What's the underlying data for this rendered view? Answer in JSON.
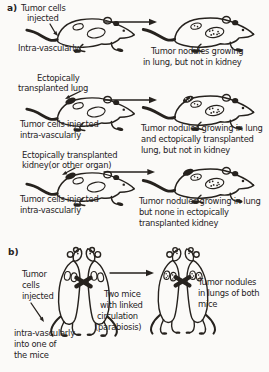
{
  "figure": {
    "ink_color": "#26221e",
    "paper_color": "#fbfaf8",
    "section_a": {
      "label": "a)",
      "row1": {
        "inject_label": [
          "Tumor cells",
          "injected"
        ],
        "route_label": "Intra-vascularly",
        "result_label": [
          "Tumor nodules growing",
          "in lung, but not in kidney"
        ]
      },
      "row2": {
        "transplant_label": [
          "Ectopically",
          "transplanted lung"
        ],
        "inject_label": [
          "Tumor cells injected",
          "intra-vascularly"
        ],
        "result_label": [
          "Tumor nodules growing in lung",
          "and ectopically transplanted",
          "lung, but not in kidney"
        ]
      },
      "row3": {
        "transplant_label": [
          "Ectopically transplanted",
          "kidney(or other organ)"
        ],
        "inject_label": [
          "Tumor cells injected",
          "intra-vascularly"
        ],
        "result_label": [
          "Tumor nodules growing in lung",
          "but none in ectopically",
          "transplanted kidney"
        ]
      }
    },
    "section_b": {
      "label": "b)",
      "inject_label": [
        "Tumor",
        "cells",
        "injected"
      ],
      "route_label": [
        "intra-vascularly",
        "into one of",
        "the mice"
      ],
      "parabiosis_label": [
        "Two mice",
        "with linked",
        "circulation",
        "(parabiosis)"
      ],
      "result_label": [
        "Tumor nodules",
        "in lungs of both",
        "mice"
      ]
    }
  }
}
